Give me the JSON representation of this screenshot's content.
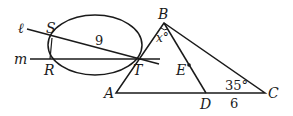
{
  "diagram": {
    "type": "geometry",
    "labels": {
      "line_l": "ℓ",
      "line_m": "m",
      "S": "S",
      "R": "R",
      "T": "T",
      "B": "B",
      "A": "A",
      "C": "C",
      "D": "D",
      "E": "E",
      "x_angle": "x°",
      "angle_c": "35°",
      "seg_st": "9",
      "seg_dc": "6"
    },
    "colors": {
      "stroke": "#1a1a1a",
      "background": "#ffffff"
    }
  }
}
